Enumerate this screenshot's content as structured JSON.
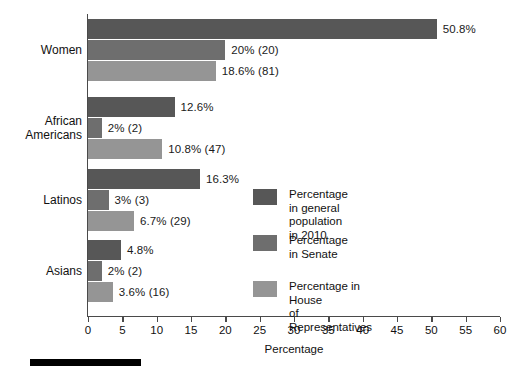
{
  "chart_data": {
    "type": "bar",
    "orientation": "horizontal",
    "title": "",
    "xlabel": "Percentage",
    "ylabel": "",
    "xlim": [
      0,
      60
    ],
    "xticks": [
      0,
      5,
      10,
      15,
      20,
      25,
      30,
      35,
      40,
      45,
      50,
      55,
      60
    ],
    "xtick_labels": [
      "0",
      "5",
      "10",
      "15",
      "20",
      "25",
      "30",
      "35",
      "40",
      "45",
      "50",
      "55",
      "60"
    ],
    "grid": false,
    "legend_position": "center-right-inside",
    "categories": [
      "Women",
      "African\nAmericans",
      "Latinos",
      "Asians"
    ],
    "series": [
      {
        "name": "Percentage in general\npopulation in 2010",
        "color": "#575757",
        "values": [
          50.8,
          12.6,
          16.3,
          4.8
        ],
        "labels": [
          "50.8%",
          "12.6%",
          "16.3%",
          "4.8%"
        ]
      },
      {
        "name": "Percentage\nin Senate",
        "color": "#6e6e6e",
        "values": [
          20,
          2,
          3,
          2
        ],
        "labels": [
          "20% (20)",
          "2% (2)",
          "3% (3)",
          "2% (2)"
        ]
      },
      {
        "name": "Percentage in House\nof Representatives",
        "color": "#959595",
        "values": [
          18.6,
          10.8,
          6.7,
          3.6
        ],
        "labels": [
          "18.6% (81)",
          "10.8% (47)",
          "6.7% (29)",
          "3.6% (16)"
        ]
      }
    ]
  },
  "axis": {
    "x_title": "Percentage"
  },
  "categories": {
    "c0": "Women",
    "c1": "African\nAmericans",
    "c2": "Latinos",
    "c3": "Asians"
  },
  "legend": {
    "item0": "Percentage in general\npopulation in 2010",
    "item1": "Percentage\nin Senate",
    "item2": "Percentage in House\nof Representatives"
  },
  "ticks": {
    "t0": "0",
    "t1": "5",
    "t2": "10",
    "t3": "15",
    "t4": "20",
    "t5": "25",
    "t6": "30",
    "t7": "35",
    "t8": "40",
    "t9": "45",
    "t10": "50",
    "t11": "55",
    "t12": "60"
  },
  "bar_labels": {
    "g0s0": "50.8%",
    "g0s1": "20% (20)",
    "g0s2": "18.6% (81)",
    "g1s0": "12.6%",
    "g1s1": "2% (2)",
    "g1s2": "10.8% (47)",
    "g2s0": "16.3%",
    "g2s1": "3% (3)",
    "g2s2": "6.7% (29)",
    "g3s0": "4.8%",
    "g3s1": "2% (2)",
    "g3s2": "3.6% (16)"
  },
  "colors": {
    "series0": "#575757",
    "series1": "#6e6e6e",
    "series2": "#959595",
    "axis": "#4a4a4a",
    "rule": "#000000"
  }
}
